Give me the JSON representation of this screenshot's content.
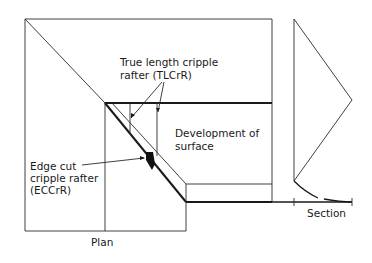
{
  "diagram": {
    "labels": {
      "tlcr_line1": "True length cripple",
      "tlcr_line2": "rafter (TLCrR)",
      "development_line1": "Development of",
      "development_line2": "surface",
      "eccr_line1": "Edge cut",
      "eccr_line2": "cripple rafter",
      "eccr_line3": "(ECCrR)",
      "plan": "Plan",
      "section": "Section"
    },
    "colors": {
      "line": "#1a1a1a",
      "background": "#ffffff"
    }
  }
}
